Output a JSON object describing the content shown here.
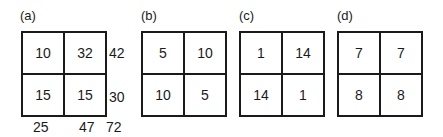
{
  "panels": [
    {
      "label": "(a)",
      "cells": [
        "10",
        "32",
        "15",
        "15"
      ],
      "row_totals": [
        "42",
        "30"
      ],
      "col_totals": [
        "25",
        "47"
      ],
      "grand_total": "72"
    },
    {
      "label": "(b)",
      "cells": [
        "5",
        "10",
        "10",
        "5"
      ]
    },
    {
      "label": "(c)",
      "cells": [
        "1",
        "14",
        "14",
        "1"
      ]
    },
    {
      "label": "(d)",
      "cells": [
        "7",
        "7",
        "8",
        "8"
      ]
    }
  ]
}
